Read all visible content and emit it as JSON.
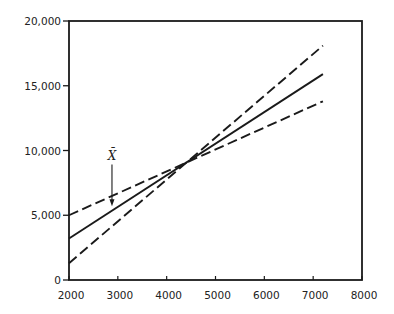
{
  "chart_data": {
    "type": "line",
    "title": "",
    "xlabel": "",
    "ylabel": "",
    "xlim": [
      2000,
      8000
    ],
    "ylim": [
      0,
      20000
    ],
    "x_ticks": [
      2000,
      3000,
      4000,
      5000,
      6000,
      7000,
      8000
    ],
    "x_tick_labels": [
      "2000",
      "3000",
      "4000",
      "5000",
      "6000",
      "7000",
      "8000"
    ],
    "y_ticks": [
      0,
      5000,
      10000,
      15000,
      20000
    ],
    "y_tick_labels": [
      "0",
      "5,000",
      "10,000",
      "15,000",
      "20,000"
    ],
    "grid": false,
    "legend": null,
    "series": [
      {
        "name": "upper-dashed (steep)",
        "style": "dashed",
        "x": [
          2000,
          7200
        ],
        "y": [
          1300,
          18100
        ]
      },
      {
        "name": "regression line",
        "style": "solid",
        "x": [
          2000,
          7200
        ],
        "y": [
          3200,
          15900
        ]
      },
      {
        "name": "lower-dashed (flat)",
        "style": "dashed",
        "x": [
          2000,
          7200
        ],
        "y": [
          5000,
          13800
        ]
      }
    ],
    "annotations": [
      {
        "text": "X̄",
        "x": 2880,
        "arrow_to_y": 5700,
        "label_y": 9300
      }
    ],
    "crossing_point": {
      "x": 4440,
      "y": 9100
    }
  },
  "plot": {
    "left": 69,
    "right": 362,
    "top": 21,
    "bottom": 280
  }
}
